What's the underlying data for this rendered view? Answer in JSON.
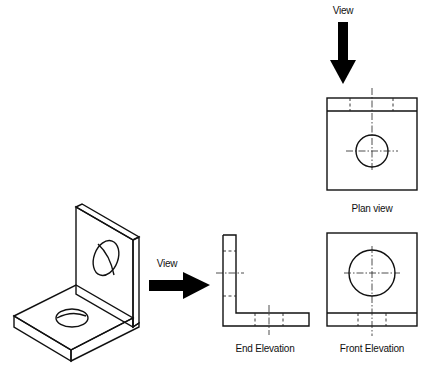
{
  "diagram": {
    "type": "orthographic-projection",
    "stroke_color": "#111111",
    "background": "#ffffff"
  },
  "labels": {
    "top_view_arrow": "View",
    "side_view_arrow": "View",
    "plan_view": "Plan view",
    "end_elevation": "End Elevation",
    "front_elevation": "Front Elevation"
  },
  "views": [
    {
      "id": "isometric",
      "description": "Isometric pictorial of L-bracket"
    },
    {
      "id": "plan",
      "label": "Plan view"
    },
    {
      "id": "end",
      "label": "End Elevation"
    },
    {
      "id": "front",
      "label": "Front Elevation"
    }
  ]
}
